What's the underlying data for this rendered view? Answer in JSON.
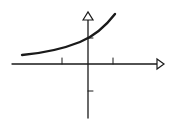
{
  "diagram": {
    "title": "",
    "colors": {
      "stroke": "#1a1a1a",
      "background": "#ffffff"
    },
    "axes": {
      "x_axis": {
        "label": "",
        "arrow": "open-triangle",
        "tick_marks": 2
      },
      "y_axis": {
        "label": "",
        "arrow": "open-triangle",
        "tick_marks": 2
      }
    },
    "curve": {
      "type": "exponential-growth",
      "y_intercept_tick": "above origin",
      "horizontal_asymptote": "positive, above x-axis"
    }
  }
}
